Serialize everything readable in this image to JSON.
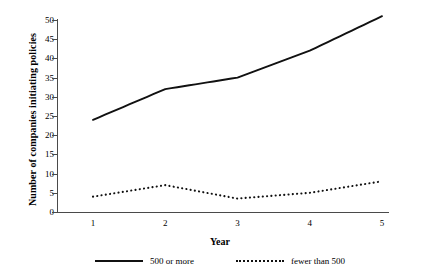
{
  "chart_data": {
    "type": "line",
    "title": "",
    "xlabel": "Year",
    "ylabel": "Number of companies initiating policies",
    "x": [
      1,
      2,
      3,
      4,
      5
    ],
    "categories": [
      "1",
      "2",
      "3",
      "4",
      "5"
    ],
    "xlim": [
      1,
      5
    ],
    "ylim": [
      0,
      50
    ],
    "yticks": [
      0,
      5,
      10,
      15,
      20,
      25,
      30,
      35,
      40,
      45,
      50
    ],
    "ytick_labels": [
      "0",
      "5",
      "10",
      "15",
      "20",
      "25",
      "30",
      "35",
      "40",
      "45",
      "50"
    ],
    "grid": false,
    "legend_position": "bottom",
    "series": [
      {
        "name": "500 or more",
        "style": "solid",
        "color": "#111111",
        "values": [
          24,
          32,
          35,
          42,
          51
        ]
      },
      {
        "name": "fewer than 500",
        "style": "dotted",
        "color": "#111111",
        "values": [
          4,
          7,
          3.5,
          5,
          8
        ]
      }
    ]
  },
  "legend": {
    "items": [
      {
        "label": "500 or more",
        "style": "solid"
      },
      {
        "label": "fewer than 500",
        "style": "dotted"
      }
    ]
  }
}
